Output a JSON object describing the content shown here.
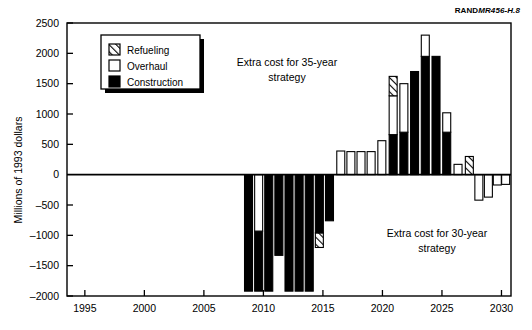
{
  "credit": {
    "brand": "RAND",
    "doc_id": "MR456-H.8"
  },
  "legend": {
    "items": [
      {
        "label": "Refueling",
        "fill": "hatch"
      },
      {
        "label": "Overhaul",
        "fill": "white"
      },
      {
        "label": "Construction",
        "fill": "black"
      }
    ]
  },
  "annotations": {
    "upper_line1": "Extra cost for 35-year",
    "upper_line2": "strategy",
    "lower_line1": "Extra cost for 30-year",
    "lower_line2": "strategy"
  },
  "colors": {
    "construction": "#000000",
    "overhaul": "#ffffff",
    "refueling": "#ffffff",
    "axis": "#000000",
    "background": "#ffffff"
  },
  "chart_data": {
    "type": "bar",
    "subtype": "stacked-bar-diverging",
    "title": "",
    "xlabel": "",
    "ylabel": "Millions of 1993 dollars",
    "xlim": [
      1993.5,
      2030.8
    ],
    "ylim": [
      -2000,
      2500
    ],
    "grid": false,
    "legend_position": "upper-left-inside",
    "xticks": [
      1995,
      2000,
      2005,
      2010,
      2015,
      2020,
      2025,
      2030
    ],
    "xtick_labels": [
      "1995",
      "2000",
      "2005",
      "2010",
      "2015",
      "2020",
      "2025",
      "2030"
    ],
    "yticks": [
      -2000,
      -1500,
      -1000,
      -500,
      0,
      500,
      1000,
      1500,
      2000,
      2500
    ],
    "ytick_labels": [
      "–2000",
      "–1500",
      "–1000",
      "–500",
      "0",
      "500",
      "1000",
      "1500",
      "2000",
      "2500"
    ],
    "categories": [
      2009,
      2010,
      2011,
      2012,
      2013,
      2014,
      2015,
      2016,
      2017,
      2018,
      2019,
      2020,
      2021,
      2022,
      2023,
      2024,
      2025,
      2026,
      2027,
      2028,
      2029,
      2030
    ],
    "series": [
      {
        "name": "Construction",
        "values": [
          -1920,
          -1920,
          -1920,
          -1920,
          -1920,
          -1920,
          -1920,
          -960,
          -960,
          0,
          0,
          660,
          700,
          1700,
          1950,
          1950,
          0,
          0,
          0,
          0,
          0,
          0
        ]
      },
      {
        "name": "Overhaul",
        "values": [
          0,
          -930,
          0,
          0,
          0,
          0,
          0,
          0,
          0,
          390,
          380,
          560,
          660,
          0,
          350,
          0,
          170,
          0,
          -420,
          -370,
          -170,
          -160
        ]
      },
      {
        "name": "Refueling",
        "values": [
          0,
          0,
          0,
          0,
          0,
          0,
          -240,
          0,
          0,
          0,
          0,
          400,
          0,
          0,
          0,
          0,
          0,
          300,
          0,
          0,
          0,
          0
        ]
      }
    ],
    "bars": [
      {
        "year": 2009,
        "segments": [
          {
            "type": "construction",
            "from": -1920,
            "to": 0
          }
        ]
      },
      {
        "year": 2010,
        "segments": [
          {
            "type": "construction",
            "from": -1920,
            "to": -930
          },
          {
            "type": "overhaul",
            "from": -930,
            "to": 0
          }
        ]
      },
      {
        "year": 2011,
        "segments": [
          {
            "type": "construction",
            "from": -1920,
            "to": 0
          }
        ]
      },
      {
        "year": 2012,
        "segments": [
          {
            "type": "construction",
            "from": -1330,
            "to": 0
          }
        ]
      },
      {
        "year": 2013,
        "segments": [
          {
            "type": "construction",
            "from": -1920,
            "to": 0
          }
        ]
      },
      {
        "year": 2014,
        "segments": [
          {
            "type": "construction",
            "from": -1920,
            "to": 0
          }
        ]
      },
      {
        "year": 2015,
        "segments": [
          {
            "type": "construction",
            "from": -1920,
            "to": 0
          }
        ]
      },
      {
        "year": 2016,
        "segments": [
          {
            "type": "refueling",
            "from": -1200,
            "to": -960
          },
          {
            "type": "construction",
            "from": -960,
            "to": 0
          }
        ]
      },
      {
        "year": 2017,
        "segments": [
          {
            "type": "construction",
            "from": -760,
            "to": 0
          }
        ]
      },
      {
        "year": 2018,
        "segments": [
          {
            "type": "overhaul",
            "from": 0,
            "to": 390
          }
        ]
      },
      {
        "year": 2019,
        "segments": [
          {
            "type": "overhaul",
            "from": 0,
            "to": 380
          }
        ]
      },
      {
        "year": 2020,
        "segments": [
          {
            "type": "overhaul",
            "from": 0,
            "to": 380
          }
        ]
      },
      {
        "year": 2021,
        "segments": [
          {
            "type": "overhaul",
            "from": 0,
            "to": 380
          }
        ]
      },
      {
        "year": 2022,
        "segments": [
          {
            "type": "overhaul",
            "from": 0,
            "to": 560
          }
        ]
      },
      {
        "year": 2023,
        "segments": [
          {
            "type": "construction",
            "from": 0,
            "to": 660
          },
          {
            "type": "overhaul",
            "from": 660,
            "to": 1300
          },
          {
            "type": "refueling",
            "from": 1300,
            "to": 1620
          }
        ]
      },
      {
        "year": 2024,
        "segments": [
          {
            "type": "construction",
            "from": 0,
            "to": 700
          },
          {
            "type": "overhaul",
            "from": 700,
            "to": 1500
          }
        ]
      },
      {
        "year": 2025,
        "segments": [
          {
            "type": "construction",
            "from": 0,
            "to": 1700
          }
        ]
      },
      {
        "year": 2026,
        "segments": [
          {
            "type": "construction",
            "from": 0,
            "to": 1950
          },
          {
            "type": "overhaul",
            "from": 1950,
            "to": 2300
          }
        ]
      },
      {
        "year": 2027,
        "segments": [
          {
            "type": "construction",
            "from": 0,
            "to": 1950
          }
        ]
      },
      {
        "year": 2028,
        "segments": [
          {
            "type": "construction",
            "from": 0,
            "to": 700
          },
          {
            "type": "overhaul",
            "from": 700,
            "to": 1020
          }
        ]
      },
      {
        "year": 2029,
        "segments": [
          {
            "type": "overhaul",
            "from": 0,
            "to": 170
          }
        ]
      },
      {
        "year": 2030,
        "segments": [
          {
            "type": "refueling",
            "from": 0,
            "to": 300
          }
        ]
      },
      {
        "year": 2031,
        "segments": [
          {
            "type": "overhaul",
            "from": -420,
            "to": 0
          }
        ]
      },
      {
        "year": 2032,
        "segments": [
          {
            "type": "overhaul",
            "from": -370,
            "to": 0
          }
        ]
      },
      {
        "year": 2033,
        "segments": [
          {
            "type": "overhaul",
            "from": -170,
            "to": 0
          }
        ]
      },
      {
        "year": 2034,
        "segments": [
          {
            "type": "overhaul",
            "from": -160,
            "to": 0
          }
        ]
      }
    ],
    "bar_x_positions": [
      2008.75,
      2009.6,
      2010.45,
      2011.3,
      2012.15,
      2013.0,
      2013.85,
      2014.7,
      2015.55,
      2016.5,
      2017.35,
      2018.2,
      2019.05,
      2019.95,
      2020.9,
      2021.8,
      2022.7,
      2023.6,
      2024.5,
      2025.4,
      2026.35,
      2027.3,
      2028.1,
      2028.9,
      2029.65,
      2030.35
    ]
  }
}
